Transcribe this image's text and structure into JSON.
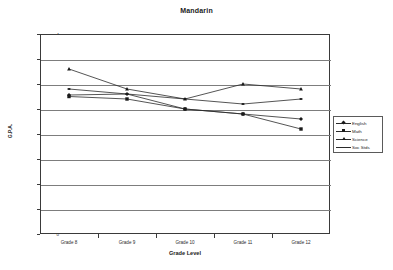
{
  "chart_data": {
    "type": "line",
    "title": "Mandarin",
    "xlabel": "Grade Level",
    "ylabel": "G.P.A.",
    "categories": [
      "Grade 8",
      "Grade 9",
      "Grade 10",
      "Grade 11",
      "Grade 12"
    ],
    "ylim": [
      0,
      4
    ],
    "ytick_step": 0.5,
    "yticks": [
      "0",
      "0.5",
      "1",
      "1.5",
      "2",
      "2.5",
      "3",
      "3.5",
      "4"
    ],
    "grid": true,
    "legend_position": "right",
    "series": [
      {
        "name": "English",
        "marker": "diamond",
        "values": [
          2.78,
          2.8,
          2.5,
          2.4,
          2.3
        ]
      },
      {
        "name": "Math",
        "marker": "square",
        "values": [
          2.75,
          2.7,
          2.5,
          2.4,
          2.1
        ]
      },
      {
        "name": "Science",
        "marker": "triangle",
        "values": [
          3.3,
          2.9,
          2.7,
          3.0,
          2.9
        ]
      },
      {
        "name": "Soc Stds",
        "marker": "line",
        "values": [
          2.9,
          2.8,
          2.7,
          2.6,
          2.7
        ]
      }
    ]
  },
  "legend": {
    "items": [
      {
        "label": "English"
      },
      {
        "label": "Math"
      },
      {
        "label": "Science"
      },
      {
        "label": "Soc Stds"
      }
    ]
  }
}
